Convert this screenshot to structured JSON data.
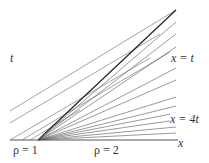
{
  "diagram": {
    "labels": {
      "t_axis": "t",
      "x_axis": "x",
      "line_x_eq_t": "x = t",
      "line_x_eq_4t": "x = 4t",
      "rho_left": "ρ = 1",
      "rho_right": "ρ = 2"
    },
    "colors": {
      "line": "#555555",
      "thick": "#222222",
      "text": "#333333"
    }
  }
}
